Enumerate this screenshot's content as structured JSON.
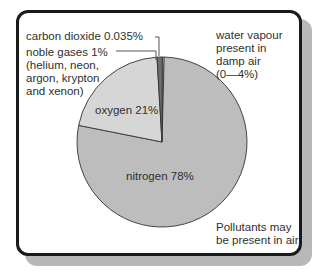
{
  "chart_data": {
    "type": "pie",
    "title": "",
    "categories": [
      "nitrogen",
      "oxygen",
      "noble gases",
      "carbon dioxide"
    ],
    "values": [
      78,
      21,
      1,
      0.035
    ],
    "labels": [
      "nitrogen 78%",
      "oxygen 21%",
      "noble gases 1%\n(helium, neon,\nargon, krypton\nand xenon)",
      "carbon dioxide 0.035%"
    ],
    "colors": [
      "#bdbdbd",
      "#d6d6d6",
      "#6e6e6e",
      "#ffffff"
    ],
    "annotations": [
      "water vapour\npresent in\ndamp air\n(0—4%)",
      "Pollutants may\nbe present in air."
    ],
    "legend": "none",
    "grid": false
  },
  "labels": {
    "co2": "carbon dioxide 0.035%",
    "noble": "noble gases 1%\n(helium, neon,\nargon, krypton\nand xenon)",
    "oxygen": "oxygen 21%",
    "nitrogen": "nitrogen 78%",
    "water": "water vapour\npresent in\ndamp air\n(0—4%)",
    "pollutants": "Pollutants may\nbe present in air."
  }
}
